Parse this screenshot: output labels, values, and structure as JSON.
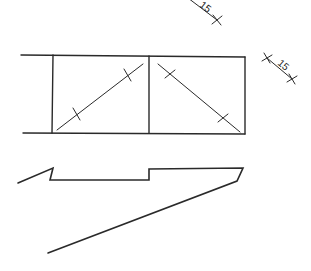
{
  "diagram": {
    "stroke_color": "#2a2a2a",
    "background": "#ffffff",
    "dimensions": [
      {
        "id": "dim-top",
        "label": "15"
      },
      {
        "id": "dim-right",
        "label": "15"
      }
    ],
    "elements": [
      "panel-frame-with-two-braced-bays",
      "profile-section-with-taper"
    ]
  }
}
